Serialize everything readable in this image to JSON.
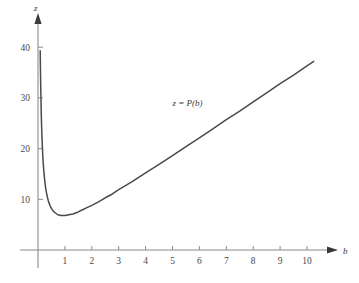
{
  "chart_data": {
    "type": "line",
    "title": "",
    "xlabel": "b",
    "ylabel": "z",
    "xlim": [
      0,
      10.8
    ],
    "ylim": [
      0,
      44
    ],
    "grid": false,
    "legend": "none",
    "annotations": [
      {
        "text": "z = P(b)",
        "x": 5.0,
        "y": 28.5,
        "name": "curve-equation-label"
      }
    ],
    "xticks": [
      1,
      2,
      3,
      4,
      5,
      6,
      7,
      8,
      9,
      10
    ],
    "xtick_labels": [
      "1",
      "2",
      "3",
      "4",
      "5",
      "6",
      "7",
      "8",
      "9",
      "10"
    ],
    "yticks": [
      10,
      20,
      30,
      40
    ],
    "ytick_labels": [
      "10",
      "20",
      "30",
      "40"
    ],
    "series": [
      {
        "name": "z = P(b)",
        "color": "#4a4a4a",
        "x": [
          0.082,
          0.09,
          0.1,
          0.11,
          0.12,
          0.13,
          0.145,
          0.16,
          0.18,
          0.2,
          0.225,
          0.25,
          0.28,
          0.31,
          0.35,
          0.4,
          0.45,
          0.5,
          0.55,
          0.6,
          0.65,
          0.7,
          0.75,
          0.8,
          0.85,
          0.9,
          0.95,
          1.0,
          1.1,
          1.2,
          1.3,
          1.4,
          1.5,
          1.6,
          1.8,
          2.0,
          2.25,
          2.5,
          2.75,
          3.0,
          3.5,
          4.0,
          4.5,
          5.0,
          5.5,
          6.0,
          6.5,
          7.0,
          7.5,
          8.0,
          8.5,
          9.0,
          9.5,
          10.0,
          10.25
        ],
        "y": [
          39.3,
          36.0,
          32.6,
          29.9,
          27.1,
          25.1,
          22.6,
          20.6,
          18.4,
          16.7,
          15.0,
          13.7,
          12.4,
          11.4,
          10.4,
          9.4,
          8.7,
          8.2,
          7.8,
          7.5,
          7.3,
          7.1,
          6.9,
          6.9,
          6.8,
          6.8,
          6.8,
          6.8,
          6.9,
          7.0,
          7.1,
          7.3,
          7.5,
          7.8,
          8.3,
          8.8,
          9.5,
          10.3,
          11.0,
          11.9,
          13.5,
          15.2,
          16.9,
          18.6,
          20.4,
          22.1,
          23.9,
          25.7,
          27.4,
          29.2,
          31.0,
          32.8,
          34.5,
          36.3,
          37.2
        ]
      }
    ],
    "curve_minimum": {
      "b": 0.94,
      "z": 6.8
    }
  },
  "axes": {
    "y_axis_label": "z",
    "x_axis_label": "b",
    "arrow_x": "x-axis-arrowhead",
    "arrow_y": "y-axis-arrowhead"
  },
  "colors": {
    "curve": "#4a4a4a",
    "axis": "#8a8a8a",
    "tick_text": "#4a4a4a",
    "background": "#ffffff"
  }
}
